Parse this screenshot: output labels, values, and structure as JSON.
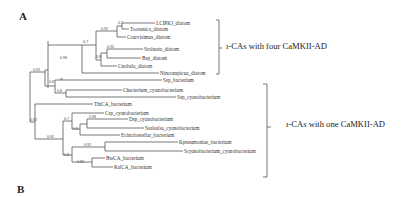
{
  "panels": {
    "a": "A",
    "b": "B"
  },
  "groups": {
    "four": {
      "prefix": "ι",
      "text": "-CAs with four CaMKII-AD"
    },
    "one": {
      "prefix": "ι",
      "text": "-CAs with one CaMKII-AD"
    }
  },
  "leaves": {
    "lcipkj": "LCIPKJ_diatom",
    "tocean": "Toceanica_diatom",
    "curv": "Ccurvisimus_diatom",
    "srob": "Srobusta_diatom",
    "bsp": "Bsp_diatom",
    "cnob": "Cnobala_diatom",
    "nins": "Ninconspicua_diatom",
    "ssp_bac": "Ssp_bacterium",
    "chact": "Chacterium_cyanobacterium",
    "ssp_cy": "Ssp_cyanobacterium",
    "thi": "ThiCA_bacterium",
    "csp": "Csp_cyanobacterium",
    "dsp": "Dsp_cyanobacterium",
    "ssal": "Ssalsalsa_cyanobacterium",
    "ecinc": "Ecinctiostellar_bacterium",
    "kpn": "Kpneumoniae_bacterium",
    "scy": "Scyanobacterium_cyanobacterium",
    "bte": "BteCA_bacterium",
    "ral": "RalCA_bacterium"
  },
  "bootstrap": {
    "n1": "0.7",
    "n2": "0.92",
    "n3": "0.7",
    "n4": "0.92",
    "n5": "0.8",
    "n6": "0.98",
    "n7": "0.92",
    "n8": "0.8",
    "n9": "0.8",
    "n10": "0.92",
    "n11": "0.7",
    "n12": "0.98",
    "n13": "0.8",
    "n14": "0.92",
    "n15": "0.8",
    "n16": "0.92",
    "n17": "0.82"
  }
}
